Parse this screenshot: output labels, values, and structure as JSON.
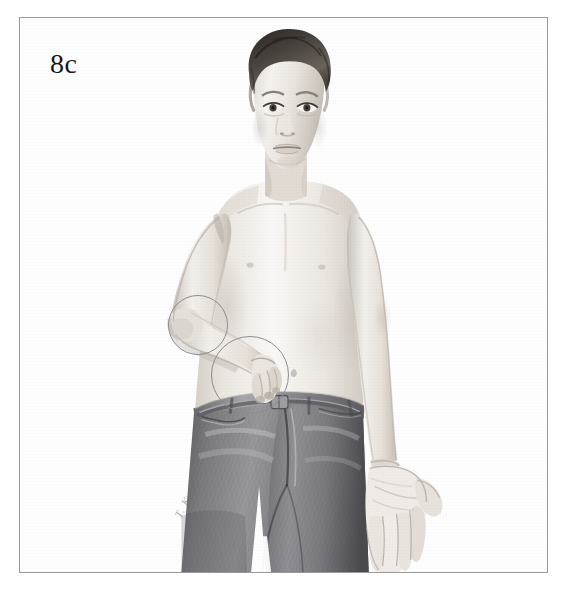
{
  "figure": {
    "panel_label": "8c",
    "caption_text": "",
    "frame_color": "#9a9a9c",
    "background_color": "#ffffff",
    "medium": "graphite pencil drawing"
  },
  "subject": {
    "description": "Pencil drawing of a shirtless young boy standing, facing forward, wearing jeans",
    "skin_tone": "#e9e3dd",
    "hair_color": "#3b3734",
    "jeans_color": "#6f6f72",
    "parts": [
      {
        "name": "head",
        "label": "head"
      },
      {
        "name": "hair",
        "label": "hair"
      },
      {
        "name": "face",
        "label": "face"
      },
      {
        "name": "torso",
        "label": "bare torso"
      },
      {
        "name": "right-arm-flexed",
        "label": "flexed right arm"
      },
      {
        "name": "left-arm-extended",
        "label": "extended left arm"
      },
      {
        "name": "left-hand-open",
        "label": "open left hand"
      },
      {
        "name": "jeans",
        "label": "jeans"
      },
      {
        "name": "belt",
        "label": "belt"
      }
    ]
  },
  "annotations": {
    "circle_color": "#8d8c90",
    "items": [
      {
        "name": "elbow-circle",
        "label": "elbow",
        "cx": 177,
        "cy": 306,
        "r": 29
      },
      {
        "name": "wrist-circle",
        "label": "wrist and hand",
        "cx": 229,
        "cy": 356,
        "r": 38
      }
    ]
  },
  "signature": {
    "text": "T. Kay",
    "visible": true
  }
}
